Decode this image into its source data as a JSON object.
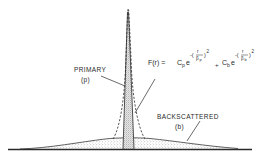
{
  "figure": {
    "type": "double-gaussian point spread diagram",
    "labels": {
      "primary": "PRIMARY",
      "primary_symbol": "(p)",
      "backscattered": "BACKSCATTERED",
      "backscattered_symbol": "(b)"
    },
    "equation": {
      "lhs": "F(r) = ",
      "term1_coeff": "C",
      "term1_coeff_sub": "p",
      "term1_base": "e",
      "term1_exp_prefix": "-(",
      "term1_frac_num": "r",
      "term1_frac_den": "β",
      "term1_frac_den_sub": "p",
      "term1_exp_suffix": ")",
      "term1_power": "2",
      "plus": "+",
      "term2_coeff": "C",
      "term2_coeff_sub": "b",
      "term2_base": "e",
      "term2_exp_prefix": "-(",
      "term2_frac_num": "r",
      "term2_frac_den": "β",
      "term2_frac_den_sub": "b",
      "term2_exp_suffix": ")",
      "term2_power": "2"
    },
    "colors": {
      "ink": "#2a2a2a",
      "background": "#ffffff",
      "stipple": "#8a8a8a"
    }
  }
}
